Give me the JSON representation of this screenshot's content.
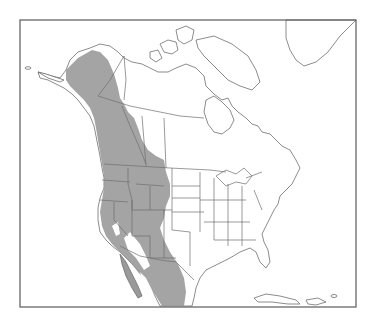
{
  "map": {
    "title": "",
    "region": "North America",
    "type": "species range map",
    "range_fill_color": "#9a9a9a",
    "outline_color": "#6e6e6e",
    "background_color": "#ffffff",
    "frame": {
      "x": 20,
      "y": 20,
      "width": 336,
      "height": 287
    },
    "range_description": "Western North America: coastal Alaska south through British Columbia, Rocky Mountain and Pacific states, into northern Mexico"
  }
}
